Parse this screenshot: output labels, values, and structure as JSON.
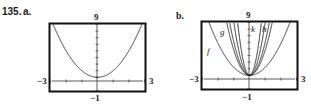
{
  "problem": {
    "number": "135.",
    "part_a": "a.",
    "part_b": "b."
  },
  "chart_data": [
    {
      "type": "line",
      "title": "",
      "panel": "a",
      "xlim": [
        -3,
        3
      ],
      "ylim": [
        -1,
        9
      ],
      "tick_labels": {
        "x_min": "−3",
        "x_max": "3",
        "y_min": "−1",
        "y_max": "9"
      },
      "grid": false,
      "series": [
        {
          "name": "",
          "equation": "y = x^2 + 1",
          "coef": 1,
          "shift": 1
        }
      ]
    },
    {
      "type": "line",
      "title": "",
      "panel": "b",
      "xlim": [
        -3,
        3
      ],
      "ylim": [
        -1,
        9
      ],
      "tick_labels": {
        "x_min": "−3",
        "x_max": "3",
        "y_min": "−1",
        "y_max": "9"
      },
      "grid": false,
      "series": [
        {
          "name": "f",
          "coef": 1.2,
          "shift": 1
        },
        {
          "name": "g",
          "coef": 3.8,
          "shift": 1
        },
        {
          "name": "",
          "coef": 5,
          "shift": 1
        },
        {
          "name": "h",
          "coef": 8,
          "shift": 1
        },
        {
          "name": "k",
          "coef": 14,
          "shift": 1
        }
      ],
      "curve_labels": [
        "f",
        "g",
        "k",
        "h"
      ]
    }
  ]
}
